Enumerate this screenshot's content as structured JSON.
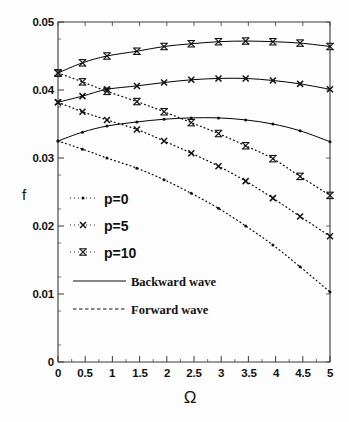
{
  "axes": {
    "ylabel": "f",
    "xlabel": "Ω",
    "yticks": [
      "0",
      "0.01",
      "0.02",
      "0.03",
      "0.04",
      "0.05"
    ],
    "xticks": [
      "0",
      "0.5",
      "1",
      "1.5",
      "2",
      "2.5",
      "3",
      "3.5",
      "4",
      "4.5",
      "5"
    ]
  },
  "legend": {
    "p0": "p=0",
    "p5": "p=5",
    "p10": "p=10",
    "backward": "Backward wave",
    "forward": "Forward wave"
  },
  "chart_data": {
    "type": "line",
    "title": "",
    "xlabel": "Ω",
    "ylabel": "f",
    "xlim": [
      0,
      5
    ],
    "ylim": [
      0,
      0.05
    ],
    "xticks": [
      0,
      0.5,
      1,
      1.5,
      2,
      2.5,
      3,
      3.5,
      4,
      4.5,
      5
    ],
    "yticks": [
      0,
      0.01,
      0.02,
      0.03,
      0.04,
      0.05
    ],
    "grid": false,
    "legend_position": "center-left",
    "minor_ticks": true,
    "x": [
      0,
      0.45,
      0.9,
      1.45,
      1.95,
      2.45,
      2.95,
      3.45,
      3.95,
      4.45,
      5
    ],
    "series": [
      {
        "name": "p=10 Backward wave",
        "p": 10,
        "wave": "backward",
        "linestyle": "solid",
        "marker": "x-bar",
        "color": "#000000",
        "values": [
          0.0425,
          0.044,
          0.045,
          0.0457,
          0.0464,
          0.0468,
          0.0471,
          0.0472,
          0.0471,
          0.0469,
          0.0464
        ]
      },
      {
        "name": "p=5 Backward wave",
        "p": 5,
        "wave": "backward",
        "linestyle": "solid",
        "marker": "x",
        "color": "#000000",
        "values": [
          0.0382,
          0.0391,
          0.0401,
          0.0406,
          0.0411,
          0.0415,
          0.0417,
          0.0417,
          0.0414,
          0.0409,
          0.0401
        ]
      },
      {
        "name": "p=0 Backward wave",
        "p": 0,
        "wave": "backward",
        "linestyle": "solid",
        "marker": "dot",
        "color": "#000000",
        "values": [
          0.0325,
          0.0338,
          0.0347,
          0.0353,
          0.0357,
          0.0359,
          0.0359,
          0.0356,
          0.035,
          0.034,
          0.0324
        ]
      },
      {
        "name": "p=10 Forward wave",
        "p": 10,
        "wave": "forward",
        "linestyle": "dotted",
        "marker": "x-bar",
        "color": "#000000",
        "values": [
          0.0425,
          0.0412,
          0.0398,
          0.0383,
          0.0368,
          0.0352,
          0.0336,
          0.0318,
          0.0299,
          0.0273,
          0.0245
        ]
      },
      {
        "name": "p=5 Forward wave",
        "p": 5,
        "wave": "forward",
        "linestyle": "dotted",
        "marker": "x",
        "color": "#000000",
        "values": [
          0.0382,
          0.0368,
          0.0356,
          0.0342,
          0.0325,
          0.0307,
          0.0288,
          0.0266,
          0.0241,
          0.0214,
          0.0185
        ]
      },
      {
        "name": "p=0 Forward wave",
        "p": 0,
        "wave": "forward",
        "linestyle": "dotted",
        "marker": "dot",
        "color": "#000000",
        "values": [
          0.0325,
          0.0313,
          0.03,
          0.0285,
          0.0268,
          0.0248,
          0.0226,
          0.02,
          0.0172,
          0.014,
          0.0103
        ]
      }
    ]
  }
}
